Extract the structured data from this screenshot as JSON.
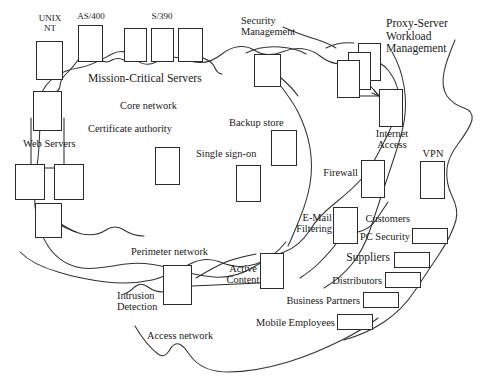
{
  "diagram": {
    "kind": "network-zone-diagram",
    "zones": [
      {
        "id": "core",
        "label": "Core network"
      },
      {
        "id": "perimeter",
        "label": "Perimeter network"
      },
      {
        "id": "access",
        "label": "Access network"
      }
    ],
    "group_labels": {
      "mission_critical": "Mission-Critical Servers",
      "web_servers": "Web Servers",
      "proxy_workload": "Proxy-Server\nWorkload\nManagement",
      "security_management": "Security\nManagement"
    },
    "labels": {
      "unix_nt": "UNIX\nNT",
      "as400": "AS/400",
      "s390": "S/390",
      "core_network": "Core network",
      "certificate_authority": "Certificate authority",
      "single_sign_on": "Single sign-on",
      "backup_store": "Backup store",
      "security_management": "Security\nManagement",
      "proxy_server_workload_management": "Proxy-Server\nWorkload\nManagement",
      "internet_access": "Internet\nAccess",
      "firewall": "Firewall",
      "vpn": "VPN",
      "email_filtering": "E-Mail\nFiltering",
      "customers": "Customers",
      "pc_security": "PC Security",
      "suppliers": "Suppliers",
      "distributors": "Distributors",
      "business_partners": "Business Partners",
      "mobile_employees": "Mobile Employees",
      "perimeter_network": "Perimeter network",
      "intrusion_detection": "Intrusion\nDetection",
      "active_content": "Active\nContent",
      "access_network": "Access network",
      "web_servers": "Web Servers",
      "mission_critical_servers": "Mission-Critical Servers"
    },
    "colors": {
      "stroke": "#2b2b2b",
      "boundary": "#333333",
      "text": "#1a1a1a",
      "background": "#ffffff"
    }
  }
}
